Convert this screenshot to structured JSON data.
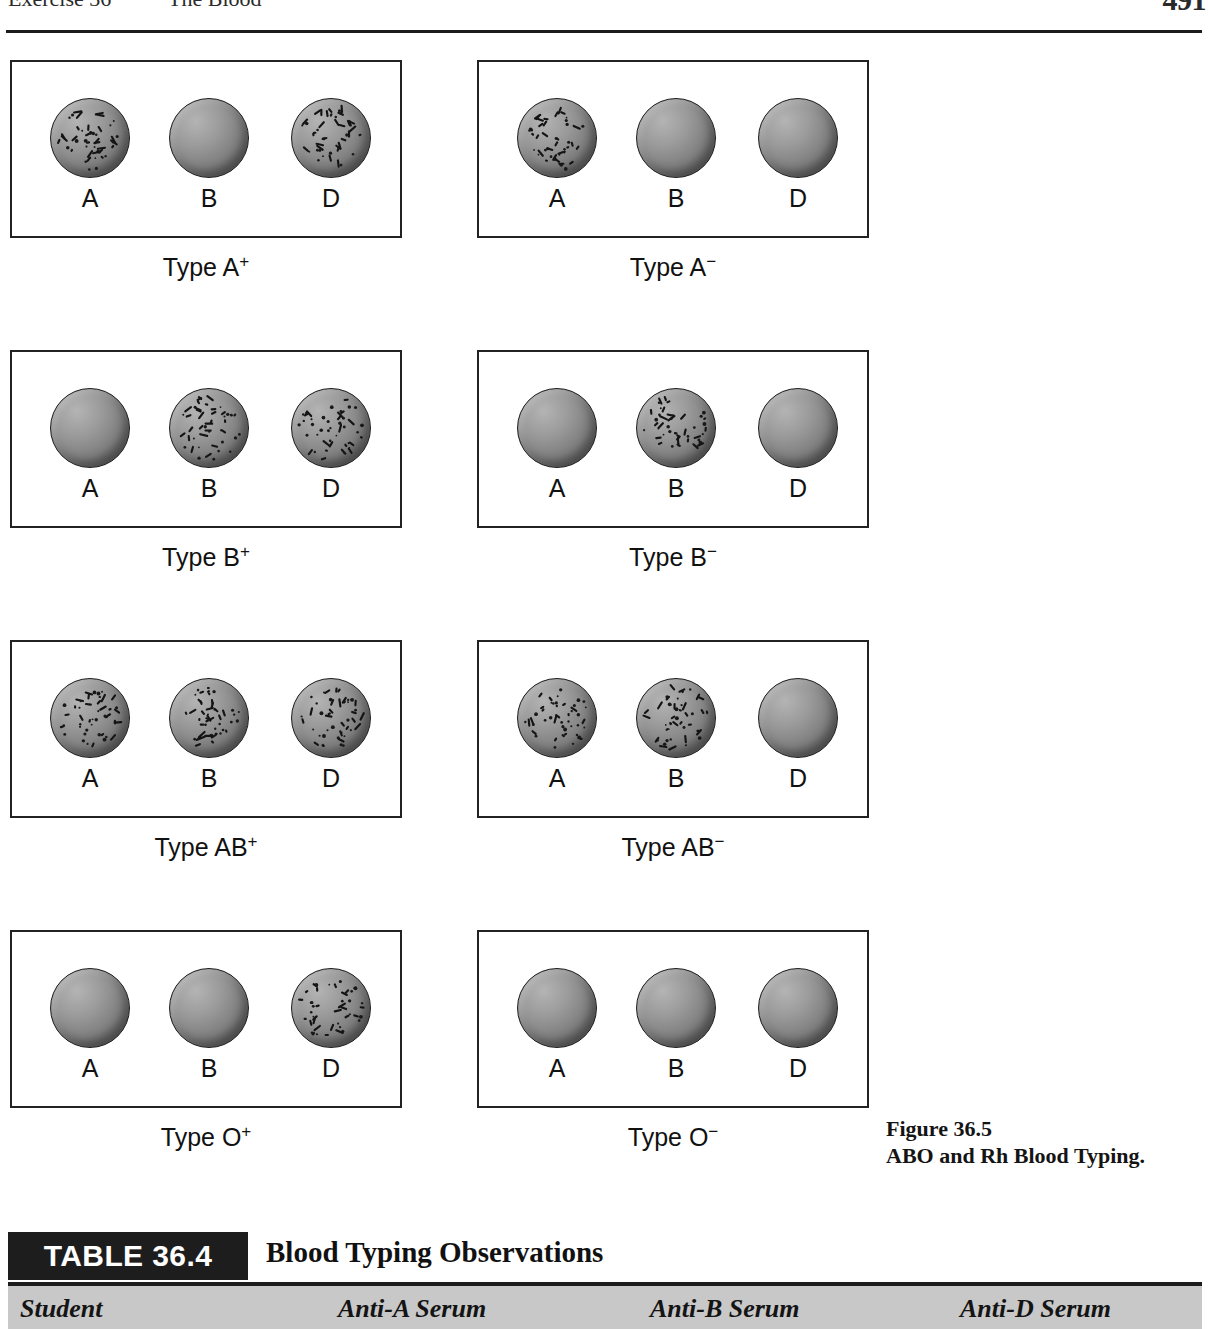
{
  "running_head": {
    "exercise": "Exercise 36",
    "title": "The Blood",
    "page_number": "491"
  },
  "figure": {
    "legend_number": "Figure 36.5",
    "legend_title": "ABO and Rh Blood Typing.",
    "well_labels": [
      "A",
      "B",
      "D"
    ],
    "panels": [
      {
        "caption_text": "Type A",
        "caption_sign": "+",
        "agglutination": [
          true,
          false,
          true
        ]
      },
      {
        "caption_text": "Type A",
        "caption_sign": "−",
        "agglutination": [
          true,
          false,
          false
        ]
      },
      {
        "caption_text": "Type B",
        "caption_sign": "+",
        "agglutination": [
          false,
          true,
          true
        ]
      },
      {
        "caption_text": "Type B",
        "caption_sign": "−",
        "agglutination": [
          false,
          true,
          false
        ]
      },
      {
        "caption_text": "Type AB",
        "caption_sign": "+",
        "agglutination": [
          true,
          true,
          true
        ]
      },
      {
        "caption_text": "Type AB",
        "caption_sign": "−",
        "agglutination": [
          true,
          true,
          false
        ]
      },
      {
        "caption_text": "Type O",
        "caption_sign": "+",
        "agglutination": [
          false,
          false,
          true
        ]
      },
      {
        "caption_text": "Type O",
        "caption_sign": "−",
        "agglutination": [
          false,
          false,
          false
        ]
      }
    ]
  },
  "table": {
    "tab_label": "TABLE 36.4",
    "heading": "Blood Typing Observations",
    "columns": [
      "Student",
      "Anti-A Serum",
      "Anti-B Serum",
      "Anti-D Serum"
    ]
  },
  "colors": {
    "ink": "#1c1c1c",
    "tab_background": "#1d1d1d",
    "tab_text": "#ffffff",
    "header_row_background": "#c8c8c8",
    "drop_gray": "#8a8a8a"
  }
}
